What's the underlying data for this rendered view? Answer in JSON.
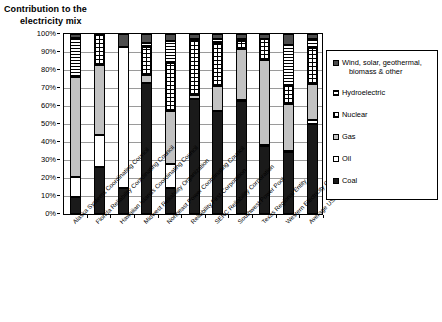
{
  "title": {
    "line1": "Contribution to the",
    "line2": "electricity mix"
  },
  "legend": {
    "items": [
      {
        "label": "Wind, solar, geothermal,",
        "label2": "biomass & other",
        "key": "wind",
        "color": "#4d4d4d",
        "pattern": "solid-dark-gray"
      },
      {
        "label": "Hydroelectric",
        "label2": "",
        "key": "hydro",
        "color": "#ffffff",
        "pattern": "horizontal-lines"
      },
      {
        "label": "Nuclear",
        "label2": "",
        "key": "nuclear",
        "color": "#ffffff",
        "pattern": "grid-dots"
      },
      {
        "label": "Gas",
        "label2": "",
        "key": "gas",
        "color": "#c2c2c2",
        "pattern": "solid-light-gray"
      },
      {
        "label": "Oil",
        "label2": "",
        "key": "oil",
        "color": "#ffffff",
        "pattern": "solid-white"
      },
      {
        "label": "Coal",
        "label2": "",
        "key": "coal",
        "color": "#1a1a1a",
        "pattern": "solid-black"
      }
    ]
  },
  "yaxis": {
    "ticks": [
      "100%",
      "90%",
      "80%",
      "70%",
      "60%",
      "50%",
      "40%",
      "30%",
      "20%",
      "10%",
      "0%"
    ]
  },
  "chart_data": {
    "type": "bar",
    "stacked": true,
    "title": "Contribution to the electricity mix",
    "xlabel": "",
    "ylabel": "",
    "ylim": [
      0,
      100
    ],
    "ytick_values": [
      0,
      10,
      20,
      30,
      40,
      50,
      60,
      70,
      80,
      90,
      100
    ],
    "grid": true,
    "legend_position": "right",
    "units": "percent",
    "categories": [
      "Alaska Systems Coordinating Council",
      "Florida Reliability Coordinating Council",
      "Hawaiian Islands Coordinating Council",
      "Midwest Reliability Organization",
      "Northeast Power Coordinating Council",
      "Reliability First Corporation",
      "SERC Reliability Corporation",
      "Southwest Power Pool",
      "Texas Regional Entity",
      "Western Electricity Coordinating Council",
      "Average USA"
    ],
    "series": [
      {
        "name": "Coal",
        "key": "coal",
        "values": [
          9.5,
          26.0,
          14.5,
          73.0,
          14.5,
          64.0,
          57.0,
          63.0,
          38.0,
          34.5,
          50.0
        ]
      },
      {
        "name": "Oil",
        "key": "oil",
        "values": [
          11.0,
          18.0,
          78.5,
          0.0,
          13.5,
          0.0,
          0.5,
          0.5,
          0.5,
          0.5,
          2.0
        ]
      },
      {
        "name": "Gas",
        "key": "gas",
        "values": [
          55.5,
          39.0,
          0.0,
          4.0,
          29.0,
          2.0,
          13.5,
          28.0,
          47.0,
          26.0,
          20.0
        ]
      },
      {
        "name": "Nuclear",
        "key": "nuclear",
        "values": [
          0.0,
          17.0,
          0.0,
          16.0,
          27.0,
          30.0,
          24.0,
          4.5,
          11.5,
          10.0,
          20.0
        ]
      },
      {
        "name": "Hydroelectric",
        "key": "hydro",
        "values": [
          22.0,
          0.0,
          0.0,
          2.0,
          12.0,
          1.0,
          2.0,
          1.5,
          0.0,
          23.0,
          5.0
        ]
      },
      {
        "name": "Wind, solar, geothermal, biomass & other",
        "key": "wind",
        "values": [
          2.0,
          0.0,
          7.0,
          5.0,
          4.0,
          3.0,
          3.0,
          2.5,
          3.0,
          6.0,
          3.0
        ]
      }
    ]
  }
}
